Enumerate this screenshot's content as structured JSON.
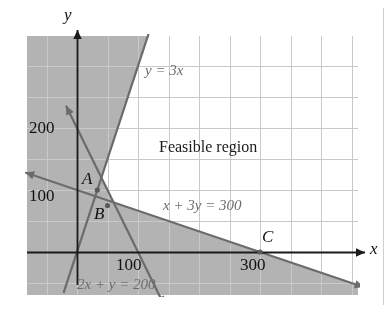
{
  "figure": {
    "kind": "linear-programming-feasible-region-graph",
    "background": "#ffffff",
    "shade_color": "#b3b3b3",
    "plot_background": "#ffffff",
    "grid_color": "#c9c9c9",
    "line_color": "#6b6b6b",
    "axis_color": "#1a1a1a"
  },
  "axes": {
    "x_label": "x",
    "y_label": "y",
    "x_ticks": [
      {
        "label": "100",
        "value": 100
      },
      {
        "label": "300",
        "value": 300
      }
    ],
    "y_ticks": [
      {
        "label": "100",
        "value": 100
      },
      {
        "label": "200",
        "value": 200
      }
    ],
    "grid_step": 50,
    "xlim": [
      -80,
      460
    ],
    "ylim": [
      -70,
      350
    ]
  },
  "annotations": {
    "feasible_region": "Feasible region",
    "line_1": {
      "text": "y = 3x",
      "lhs": "y",
      "rel": "=",
      "rhs": "3x",
      "slope": 3,
      "intercept": 0
    },
    "line_2": {
      "text": "x + 3y = 300",
      "a": 1,
      "b": 3,
      "c": 300
    },
    "line_3": {
      "text": "2x + y = 200",
      "a": 2,
      "b": 1,
      "c": 200
    }
  },
  "vertices": [
    {
      "name": "A",
      "x": 33.33,
      "y": 100,
      "label": "A"
    },
    {
      "name": "B",
      "x": 50,
      "y": 75,
      "label": "B"
    },
    {
      "name": "C",
      "x": 300,
      "y": 0,
      "label": "C"
    }
  ],
  "chart_data": {
    "type": "line",
    "title": "",
    "xlabel": "x",
    "ylabel": "y",
    "xlim": [
      -80,
      460
    ],
    "ylim": [
      -70,
      350
    ],
    "grid": true,
    "grid_step": 50,
    "legend": "none",
    "series": [
      {
        "name": "y = 3x",
        "kind": "line",
        "slope": 3,
        "intercept": 0,
        "points": [
          [
            -25,
            -75
          ],
          [
            130,
            390
          ]
        ]
      },
      {
        "name": "x + 3y = 300",
        "kind": "line",
        "slope": -0.3333,
        "intercept": 100,
        "points": [
          [
            -90,
            130
          ],
          [
            470,
            -56.7
          ]
        ]
      },
      {
        "name": "2x + y = 200",
        "kind": "line",
        "slope": -2,
        "intercept": 200,
        "points": [
          [
            -20,
            240
          ],
          [
            145,
            -90
          ]
        ]
      }
    ],
    "region": {
      "name": "Feasible region",
      "fill": "#ffffff",
      "outside_fill": "#b3b3b3",
      "vertices": [
        [
          33.33,
          100
        ],
        [
          50,
          75
        ],
        [
          300,
          0
        ]
      ]
    },
    "annotations": [
      {
        "text": "Feasible region",
        "x": 185,
        "y": 185
      },
      {
        "text": "y = 3x",
        "x": 118,
        "y": 300
      },
      {
        "text": "x + 3y = 300",
        "x": 185,
        "y": 80
      },
      {
        "text": "2x + y = 200",
        "x": 60,
        "y": -50
      },
      {
        "text": "A",
        "x": 28,
        "y": 115
      },
      {
        "text": "B",
        "x": 48,
        "y": 55
      },
      {
        "text": "C",
        "x": 305,
        "y": 25
      }
    ]
  }
}
